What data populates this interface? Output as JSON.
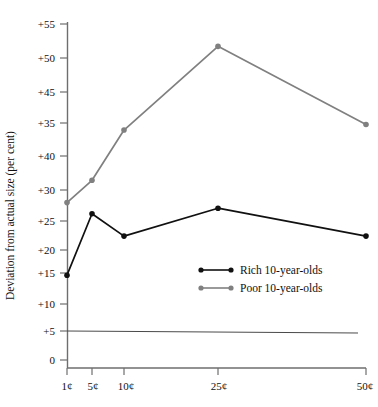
{
  "chart_data": {
    "type": "line",
    "title": "",
    "xlabel": "",
    "ylabel": "Deviation from actual size (per cent)",
    "categories": [
      "1¢",
      "5¢",
      "10¢",
      "25¢",
      "50¢"
    ],
    "x_values": [
      1,
      5,
      10,
      25,
      50
    ],
    "x_tick_labels": [
      "1¢",
      "5¢",
      "10¢",
      "25¢",
      "50¢"
    ],
    "y_tick_labels": [
      "+55",
      "+50",
      "+45",
      "+35",
      "+40",
      "+30",
      "+25",
      "+20",
      "+15",
      "+10",
      "+5",
      "0",
      "–5"
    ],
    "y_tick_values": [
      55,
      50,
      45,
      40,
      35,
      30,
      25,
      20,
      15,
      10,
      5,
      0,
      -5
    ],
    "ylim": [
      -5,
      55
    ],
    "grid": false,
    "zero_line": true,
    "legend_position": "center-right",
    "series": [
      {
        "name": "Rich 10-year-olds",
        "color": "#111111",
        "values": [
          10,
          21,
          17,
          22,
          17
        ]
      },
      {
        "name": "Poor 10-year-olds",
        "color": "#808080",
        "values": [
          23,
          27,
          36,
          51,
          37
        ]
      }
    ]
  },
  "legend": {
    "entries": [
      {
        "label": "Rich 10-year-olds",
        "color": "#111111"
      },
      {
        "label": "Poor 10-year-olds",
        "color": "#808080"
      }
    ]
  },
  "axis": {
    "y_title": "Deviation from actual size (per cent)"
  }
}
